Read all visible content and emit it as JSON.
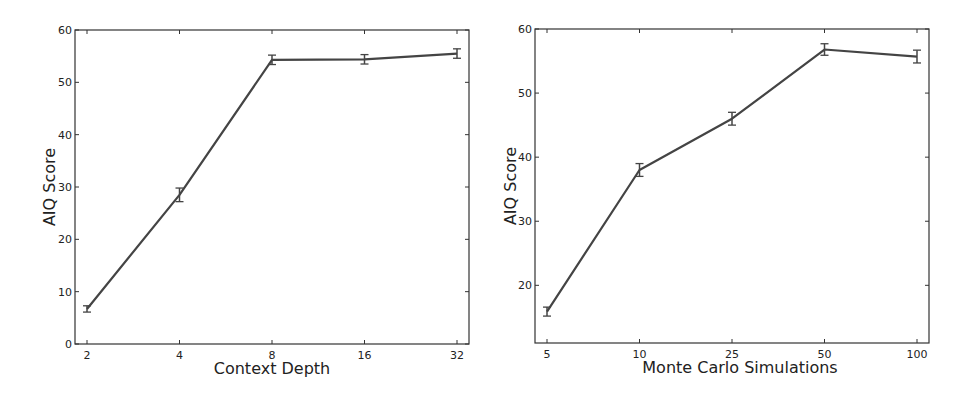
{
  "chart_data": [
    {
      "type": "line",
      "title": "",
      "xlabel": "Context Depth",
      "ylabel": "AIQ Score",
      "categories": [
        "2",
        "4",
        "8",
        "16",
        "32"
      ],
      "x_scale": "categorical (log2-spaced)",
      "series": [
        {
          "name": "AIQ Score",
          "values": [
            6.7,
            28.5,
            54.3,
            54.4,
            55.5
          ],
          "error": [
            0.6,
            1.3,
            0.9,
            0.9,
            0.9
          ],
          "color": "#444444"
        }
      ],
      "ylim": [
        0,
        60
      ],
      "yticks": [
        0,
        10,
        20,
        30,
        40,
        50,
        60
      ],
      "grid": false,
      "legend": null
    },
    {
      "type": "line",
      "title": "",
      "xlabel": "Monte Carlo Simulations",
      "ylabel": "AIQ Score",
      "categories": [
        "5",
        "10",
        "25",
        "50",
        "100"
      ],
      "x_scale": "categorical",
      "series": [
        {
          "name": "AIQ Score",
          "values": [
            15.9,
            38.0,
            46.0,
            56.8,
            55.7
          ],
          "error": [
            0.7,
            1.0,
            1.0,
            0.9,
            1.0
          ],
          "color": "#444444"
        }
      ],
      "ylim": [
        11,
        60
      ],
      "yticks": [
        20,
        30,
        40,
        50,
        60
      ],
      "grid": false,
      "legend": null
    }
  ],
  "charts": [
    {
      "xlabel": "Context Depth",
      "ylabel": "AIQ Score",
      "xtick_labels": [
        "2",
        "4",
        "8",
        "16",
        "32"
      ],
      "ytick_labels": [
        "0",
        "10",
        "20",
        "30",
        "40",
        "50",
        "60"
      ]
    },
    {
      "xlabel": "Monte Carlo Simulations",
      "ylabel": "AIQ Score",
      "xtick_labels": [
        "5",
        "10",
        "25",
        "50",
        "100"
      ],
      "ytick_labels": [
        "20",
        "30",
        "40",
        "50",
        "60"
      ]
    }
  ]
}
